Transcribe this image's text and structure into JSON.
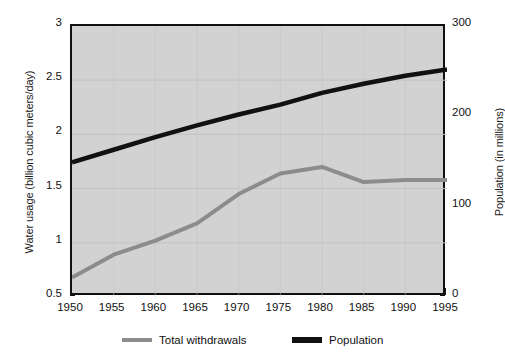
{
  "chart_data": {
    "type": "line",
    "title": "",
    "xlabel": "",
    "ylabel": "Water usage (billion cubic meters/day)",
    "ylabel_right": "Population (in millions)",
    "grid": true,
    "legend_position": "bottom",
    "xlim": [
      1950,
      1995
    ],
    "ylim": [
      0.5,
      3
    ],
    "ylim_right": [
      0,
      300
    ],
    "xticks": [
      1950,
      1955,
      1960,
      1965,
      1970,
      1975,
      1980,
      1985,
      1990,
      1995
    ],
    "xtick_labels": [
      "1950",
      "1955",
      "1960",
      "1965",
      "1970",
      "1975",
      "1980",
      "1985",
      "1990",
      "1995"
    ],
    "xtick_minor_step": 1,
    "yticks_left": [
      0.5,
      1,
      1.5,
      2,
      2.5,
      3
    ],
    "ytick_labels_left": [
      "0.5",
      "1",
      "1.5",
      "2",
      "2.5",
      "3"
    ],
    "yticks_right": [
      0,
      100,
      200,
      300
    ],
    "ytick_labels_right": [
      "0",
      "100",
      "200",
      "300"
    ],
    "x": [
      1950,
      1955,
      1960,
      1965,
      1970,
      1975,
      1980,
      1985,
      1990,
      1995
    ],
    "series": [
      {
        "name": "Total withdrawals",
        "axis": "left",
        "color": "#8c8c8c",
        "line_width": 4,
        "units": "billion cubic meters/day",
        "values": [
          0.68,
          0.89,
          1.02,
          1.18,
          1.45,
          1.64,
          1.7,
          1.56,
          1.58,
          1.58
        ]
      },
      {
        "name": "Population",
        "axis": "right",
        "color": "#111111",
        "line_width": 4.5,
        "units": "millions",
        "values": [
          149,
          163,
          177,
          190,
          202,
          213,
          226,
          236,
          245,
          252
        ],
        "values_on_left_scale": [
          1.74,
          1.86,
          1.97,
          2.08,
          2.18,
          2.28,
          2.38,
          2.47,
          2.54,
          2.6
        ]
      }
    ],
    "colors": {
      "plot_background": "#d2d2d2",
      "figure_background": "#ffffff",
      "axis": "#111111",
      "gridline": "#c3c3c3",
      "withdrawals": "#8c8c8c",
      "population": "#111111"
    }
  },
  "legend": {
    "items": [
      {
        "label": "Total withdrawals",
        "swatch": "line-swatch-gray"
      },
      {
        "label": "Population",
        "swatch": "line-swatch-black"
      }
    ]
  },
  "axes": {
    "left_title": "Water usage (billion cubic meters/day)",
    "right_title": "Population (in millions)"
  }
}
